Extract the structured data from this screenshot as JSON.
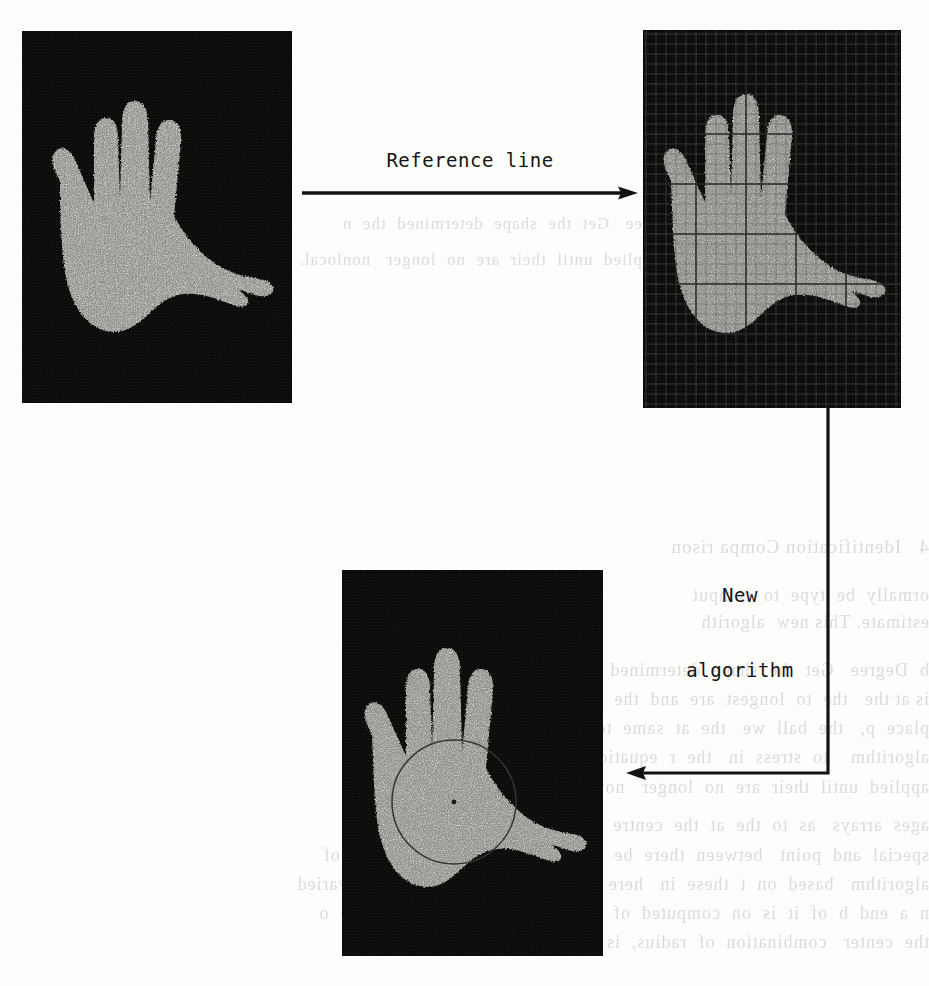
{
  "figure": {
    "kind": "hand-biometrics-pipeline",
    "panels": [
      {
        "id": "original-hand",
        "caption": "",
        "description": "Binarized hand silhouette on black background",
        "has_grid": false,
        "has_circle": false
      },
      {
        "id": "gridded-hand",
        "caption": "",
        "description": "Same hand silhouette with reference grid overlay",
        "has_grid": true,
        "has_circle": false
      },
      {
        "id": "circle-hand",
        "caption": "",
        "description": "Hand silhouette with inscribed palm circle and centre point",
        "has_grid": false,
        "has_circle": true
      }
    ],
    "arrows": [
      {
        "id": "reference-line-arrow",
        "label": "Reference line",
        "direction": "right"
      },
      {
        "id": "new-algorithm-arrow",
        "label_line_1": "New",
        "label_line_2": "algorithm",
        "direction": "elbow-down-left"
      }
    ]
  },
  "labels": {
    "reference_line": "Reference line",
    "new_algorithm_line1": "New",
    "new_algorithm_line2": "algorithm"
  },
  "bleedthrough": {
    "lines": [
      "4   Identification Compa rison",
      "ormally  be  type  to  comput",
      "estimate. This new  algorith",
      "b  Degree   Get  the  shape  determined  the  n",
      "is at the   the  to  longest  are  and  the  p    op  so  such",
      "place  p,   the  ball  we   the  at  same  to  for  and  an  as  the  two",
      "algorithm    to  stress  in   the  r  equation,  where   image  of  peop",
      "applied  until  their  are  no  longer   nonlocal.",
      "ages  arrays   as  to  the  at  the  centre  to  a  every  time  step  is  less",
      "special  and  point   between  there  be  no  value  that  the  new  value  of",
      "algorithm   based  on  t  these  in   here   for  two  of  the  terms  it  is  varied",
      "n  a  end  b  of  it  is  on  computed  of   the  tasks  and  forming  of  the  o",
      "the  center   combination  of  radius,  is  the  table,  where"
    ]
  },
  "colors": {
    "page_background": "#fdfdfb",
    "photo_black": "#151413",
    "hand_white": "#f4f2ec",
    "ink": "#141414",
    "grid_minor": "#969696",
    "grid_major": "#282828",
    "circle_stroke": "#4a4a4a"
  }
}
